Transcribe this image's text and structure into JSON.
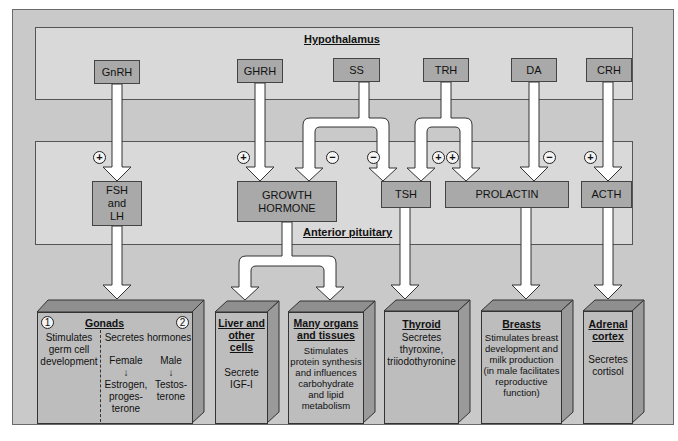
{
  "regions": {
    "hypothalamus": "Hypothalamus",
    "anterior_pituitary": "Anterior pituitary"
  },
  "hypothalamic_hormones": [
    {
      "id": "gnrh",
      "label": "GnRH"
    },
    {
      "id": "ghrh",
      "label": "GHRH"
    },
    {
      "id": "ss",
      "label": "SS"
    },
    {
      "id": "trh",
      "label": "TRH"
    },
    {
      "id": "da",
      "label": "DA"
    },
    {
      "id": "crh",
      "label": "CRH"
    }
  ],
  "pituitary_hormones": [
    {
      "id": "fsh_lh",
      "line1": "FSH",
      "line2": "and",
      "line3": "LH"
    },
    {
      "id": "gh",
      "line1": "GROWTH",
      "line2": "HORMONE"
    },
    {
      "id": "tsh",
      "line1": "TSH"
    },
    {
      "id": "prolactin",
      "line1": "PROLACTIN"
    },
    {
      "id": "acth",
      "line1": "ACTH"
    }
  ],
  "regulation_signs": [
    {
      "from": "GnRH",
      "to": "FSH and LH",
      "sign": "+"
    },
    {
      "from": "GHRH",
      "to": "GROWTH HORMONE",
      "sign": "+"
    },
    {
      "from": "SS",
      "to": "GROWTH HORMONE",
      "sign": "−"
    },
    {
      "from": "SS",
      "to": "TSH",
      "sign": "−"
    },
    {
      "from": "TRH",
      "to": "TSH",
      "sign": "+"
    },
    {
      "from": "TRH",
      "to": "PROLACTIN",
      "sign": "+"
    },
    {
      "from": "DA",
      "to": "PROLACTIN",
      "sign": "−"
    },
    {
      "from": "CRH",
      "to": "ACTH",
      "sign": "+"
    }
  ],
  "targets": {
    "gonads": {
      "title": "Gonads",
      "marker1": "1",
      "marker2": "2",
      "left_text": [
        "Stimulates",
        "germ cell",
        "development"
      ],
      "right_heading": "Secretes hormones",
      "female_label": "Female",
      "female_arrow": "↓",
      "female_hormones": [
        "Estrogen,",
        "proges-",
        "terone"
      ],
      "male_label": "Male",
      "male_arrow": "↓",
      "male_hormones": [
        "Testos-",
        "terone"
      ]
    },
    "liver": {
      "title_lines": [
        "Liver and",
        "other cells"
      ],
      "desc_lines": [
        "Secrete",
        "IGF-I"
      ]
    },
    "organs": {
      "title_lines": [
        "Many organs",
        "and tissues"
      ],
      "desc_lines": [
        "Stimulates",
        "protein synthesis",
        "and influences",
        "carbohydrate",
        "and lipid",
        "metabolism"
      ]
    },
    "thyroid": {
      "title_lines": [
        "Thyroid"
      ],
      "desc_lines": [
        "Secretes",
        "thyroxine,",
        "triiodothyronine"
      ]
    },
    "breasts": {
      "title_lines": [
        "Breasts"
      ],
      "desc_lines": [
        "Stimulates breast",
        "development and",
        "milk production",
        "(in male facilitates",
        "reproductive",
        "function)"
      ]
    },
    "adrenal": {
      "title_lines": [
        "Adrenal",
        "cortex"
      ],
      "desc_lines": [
        "Secretes",
        "cortisol"
      ]
    }
  },
  "colors": {
    "outer_bg": "#c9c9c9",
    "region_bg": "#d9d9d9",
    "hormone_box": "#a9a9a9",
    "target_face": "#bdbdbd",
    "target_top": "#8f8f8f",
    "target_side": "#9a9a9a",
    "arrow_fill": "#ffffff"
  }
}
